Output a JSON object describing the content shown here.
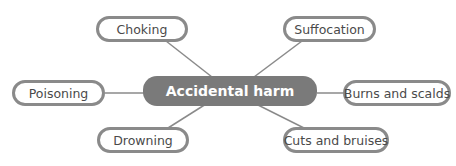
{
  "diagram": {
    "type": "mind-map",
    "center": {
      "label": "Accidental harm",
      "fill": "#7a7a7a",
      "text_color": "#ffffff"
    },
    "node_border_color": "#8a8a8a",
    "link_color": "#8a8a8a",
    "nodes": [
      {
        "id": "choking",
        "label": "Choking"
      },
      {
        "id": "suffocation",
        "label": "Suffocation"
      },
      {
        "id": "poisoning",
        "label": "Poisoning"
      },
      {
        "id": "burns",
        "label": "Burns and scalds"
      },
      {
        "id": "drowning",
        "label": "Drowning"
      },
      {
        "id": "cuts",
        "label": "Cuts and bruises"
      }
    ]
  }
}
